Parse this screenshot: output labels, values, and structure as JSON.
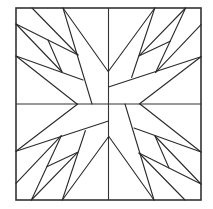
{
  "diagram": {
    "type": "quilt-block-line-drawing",
    "line_color": "#2a2a2a",
    "background": "#ffffff",
    "quadrants": 4,
    "symmetry": "4-fold rotational"
  }
}
